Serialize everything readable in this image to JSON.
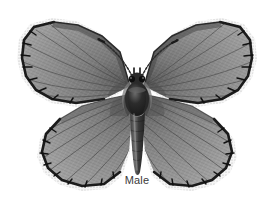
{
  "figure": {
    "caption": "Male",
    "background_color": "#ffffff",
    "width": 274,
    "height": 208
  },
  "palette": {
    "background": "#ffffff",
    "wing_base": "#8d8d8d",
    "wing_light": "#a6a6a6",
    "wing_dark": "#6e6e6e",
    "wing_inner_shadow": "#5e5e5e",
    "vein": "#4a4a4a",
    "margin_border": "#1b1b1b",
    "fringe": "#f2f2f2",
    "fringe_speckle": "#9a9a9a",
    "body_dark": "#1e1e1e",
    "body_mid": "#4e4e4e",
    "body_light": "#8f8f8f",
    "antenna": "#2b2b2b",
    "caption_text": "#3a3a3a"
  },
  "anatomy": {
    "parts": [
      {
        "name": "left-forewing",
        "label": "Left forewing"
      },
      {
        "name": "right-forewing",
        "label": "Right forewing"
      },
      {
        "name": "left-hindwing",
        "label": "Left hindwing"
      },
      {
        "name": "right-hindwing",
        "label": "Right hindwing"
      },
      {
        "name": "thorax",
        "label": "Thorax"
      },
      {
        "name": "head",
        "label": "Head"
      },
      {
        "name": "abdomen",
        "label": "Abdomen"
      },
      {
        "name": "left-antenna",
        "label": "Left antenna"
      },
      {
        "name": "right-antenna",
        "label": "Right antenna"
      }
    ],
    "body_axis_x": 137,
    "forewing_apex_y": 22,
    "hindwing_bottom_y": 188,
    "wingspan_left_x": 18,
    "wingspan_right_x": 256
  }
}
